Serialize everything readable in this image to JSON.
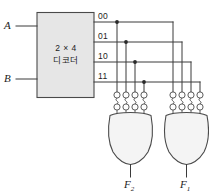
{
  "figure": {
    "kind": "logic-circuit-diagram",
    "width": 209,
    "height": 196
  },
  "colors": {
    "wire": "#3a3a3a",
    "outline": "#4a4a4a",
    "box_fill": "#e6e6e6",
    "gate_fill": "#f4f4f4",
    "bubble_fill": "#fdfdfd",
    "junction": "#2a2a2a",
    "background": "#ffffff",
    "text": "#1c1c1c"
  },
  "inputs": [
    {
      "label": "A",
      "name": "input-a"
    },
    {
      "label": "B",
      "name": "input-b"
    }
  ],
  "decoder": {
    "line1": "2 × 4",
    "line2": "디코더",
    "outputs": [
      {
        "label": "00",
        "name": "decoder-output-00"
      },
      {
        "label": "01",
        "name": "decoder-output-01"
      },
      {
        "label": "10",
        "name": "decoder-output-10"
      },
      {
        "label": "11",
        "name": "decoder-output-11"
      }
    ]
  },
  "gates": [
    {
      "name": "or-gate-f2",
      "type": "OR",
      "output_label": "F",
      "output_subscript": "2",
      "input_count": 4,
      "bubble_rows": 2
    },
    {
      "name": "or-gate-f1",
      "type": "OR",
      "output_label": "F",
      "output_subscript": "1",
      "input_count": 4,
      "bubble_rows": 2
    }
  ],
  "connections": {
    "junction_count": 4,
    "note": "Each decoder output taps down to the left OR gate and continues right to the right OR gate."
  }
}
